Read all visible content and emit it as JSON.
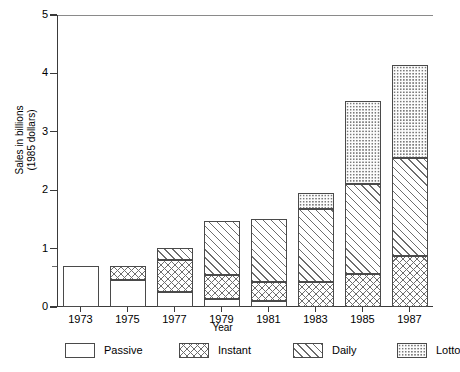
{
  "chart_data": {
    "type": "bar",
    "stacked": true,
    "title": "",
    "xlabel": "Year",
    "ylabel": "Sales in billions\n(1985 dollars)",
    "categories": [
      "1973",
      "1975",
      "1977",
      "1979",
      "1981",
      "1983",
      "1985",
      "1987"
    ],
    "ylim": [
      0,
      5
    ],
    "yticks": [
      0,
      1,
      2,
      3,
      4,
      5
    ],
    "ytick_labels": [
      "0",
      "1",
      "2",
      "3",
      "4",
      "5"
    ],
    "grid": false,
    "legend_position": "bottom",
    "series": [
      {
        "name": "Passive",
        "pattern": "solid-white",
        "values": [
          0.7,
          0.46,
          0.25,
          0.13,
          0.11,
          0.0,
          0.0,
          0.0
        ]
      },
      {
        "name": "Instant",
        "pattern": "cross-hatch",
        "values": [
          0.0,
          0.24,
          0.55,
          0.42,
          0.32,
          0.43,
          0.57,
          0.87
        ]
      },
      {
        "name": "Daily",
        "pattern": "diagonal-hatch",
        "values": [
          0.0,
          0.0,
          0.21,
          0.93,
          1.08,
          1.25,
          1.54,
          1.68
        ]
      },
      {
        "name": "Lotto",
        "pattern": "dotted",
        "values": [
          0.0,
          0.0,
          0.0,
          0.0,
          0.0,
          0.27,
          1.42,
          1.6
        ]
      }
    ],
    "totals": [
      0.7,
      0.7,
      1.01,
      1.48,
      1.51,
      1.95,
      3.53,
      4.15
    ]
  },
  "legend": {
    "items": [
      {
        "label": "Passive"
      },
      {
        "label": "Instant"
      },
      {
        "label": "Daily"
      },
      {
        "label": "Lotto"
      }
    ]
  }
}
